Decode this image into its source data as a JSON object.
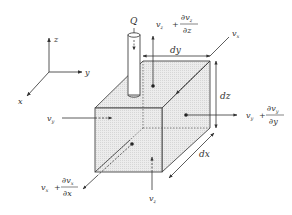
{
  "diagram": {
    "type": "control-volume-element",
    "axes": {
      "z": "z",
      "y": "y",
      "x": "x"
    },
    "source": {
      "label": "Q"
    },
    "dimensions": {
      "dx": "dx",
      "dy": "dy",
      "dz": "dz"
    },
    "velocities": {
      "vz_in": {
        "base": "v",
        "sub": "z"
      },
      "vz_out": {
        "base": "v",
        "sub": "z",
        "plus": "+",
        "num": "∂v",
        "num_sub": "z",
        "den": "∂z"
      },
      "vy_in": {
        "base": "v",
        "sub": "y"
      },
      "vy_out": {
        "base": "v",
        "sub": "y",
        "plus": "+",
        "num": "∂v",
        "num_sub": "y",
        "den": "∂y"
      },
      "vx_in": {
        "base": "v",
        "sub": "x"
      },
      "vx_out": {
        "base": "v",
        "sub": "x",
        "plus": "+",
        "num": "∂v",
        "num_sub": "x",
        "den": "∂x"
      }
    },
    "colors": {
      "line": "#333333",
      "face_fill": "#e8e8e8",
      "background": "#ffffff"
    }
  }
}
